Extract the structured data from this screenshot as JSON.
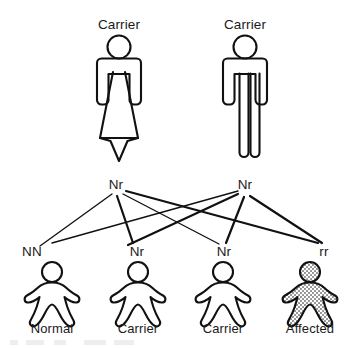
{
  "diagram": {
    "line_color": "#111111",
    "figure_outline_color": "#111111",
    "affected_fill_color": "#b4b4b4",
    "background_color": "#ffffff"
  },
  "parents": [
    {
      "caption": "Carrier",
      "genotype": "Nr",
      "sex": "female",
      "icon": "female-figure-icon",
      "x": 119
    },
    {
      "caption": "Carrier",
      "genotype": "Nr",
      "sex": "male",
      "icon": "male-figure-icon",
      "x": 245
    }
  ],
  "children": [
    {
      "genotype": "NN",
      "caption": "Normal",
      "status": "normal",
      "affected": false,
      "icon": "child-figure-icon",
      "x": 52
    },
    {
      "genotype": "Nr",
      "caption": "Carrier",
      "status": "carrier",
      "affected": false,
      "icon": "child-figure-icon",
      "x": 138
    },
    {
      "genotype": "Nr",
      "caption": "Carrier",
      "status": "carrier",
      "affected": false,
      "icon": "child-figure-icon",
      "x": 223
    },
    {
      "genotype": "rr",
      "caption": "Affected",
      "status": "affected",
      "affected": true,
      "icon": "child-figure-affected-icon",
      "x": 310
    }
  ]
}
